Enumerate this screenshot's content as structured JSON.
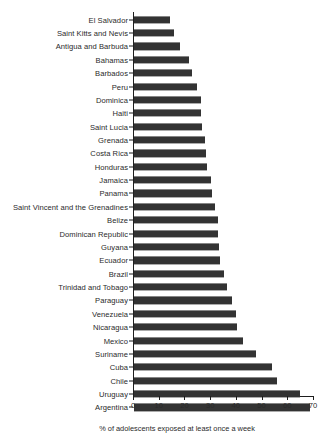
{
  "chart_data": {
    "type": "bar",
    "orientation": "horizontal",
    "title": "",
    "subtitle": "",
    "xlabel": "% of adolescents exposed at least once a week",
    "ylabel": "",
    "xlim": [
      0,
      70
    ],
    "xticks": [
      0,
      10,
      20,
      30,
      40,
      50,
      60,
      70
    ],
    "xtick_labels": [
      "0",
      "10",
      "20",
      "30",
      "40",
      "50",
      "60",
      "70"
    ],
    "grid": false,
    "legend": null,
    "bar_color": "#333333",
    "axis_color": "#1e1e1e",
    "background_color": "#ffffff",
    "categories": [
      "El Salvador",
      "Saint Kitts and Nevis",
      "Antigua and Barbuda",
      "Bahamas",
      "Barbados",
      "Peru",
      "Dominica",
      "Haiti",
      "Saint Lucia",
      "Grenada",
      "Costa Rica",
      "Honduras",
      "Jamaica",
      "Panama",
      "Saint Vincent and the Grenadines",
      "Belize",
      "Dominican Republic",
      "Guyana",
      "Ecuador",
      "Brazil",
      "Trinidad and Tobago",
      "Paraguay",
      "Venezuela",
      "Nicaragua",
      "Mexico",
      "Suriname",
      "Cuba",
      "Chile",
      "Uruguay",
      "Argentina"
    ],
    "values": [
      14.0,
      15.5,
      18.0,
      21.5,
      22.5,
      24.5,
      26.0,
      26.0,
      26.5,
      27.5,
      28.0,
      28.5,
      30.0,
      30.5,
      31.5,
      32.5,
      32.5,
      33.0,
      33.5,
      35.0,
      36.0,
      38.0,
      39.5,
      40.0,
      42.5,
      47.5,
      53.5,
      55.5,
      64.5,
      68.5
    ]
  }
}
